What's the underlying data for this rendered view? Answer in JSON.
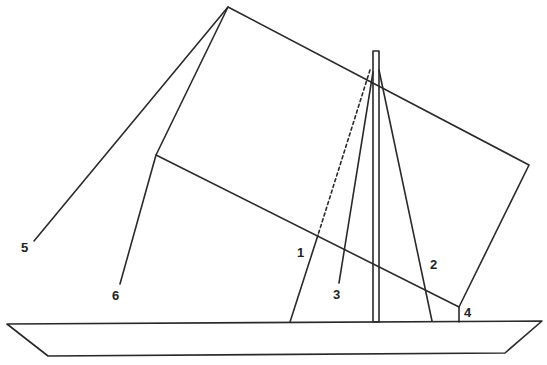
{
  "figure": {
    "type": "sailboat-rigging-diagram",
    "labels": [
      {
        "id": "1",
        "text": "1",
        "x": 297,
        "y": 246
      },
      {
        "id": "2",
        "text": "2",
        "x": 430,
        "y": 258
      },
      {
        "id": "3",
        "text": "3",
        "x": 333,
        "y": 288
      },
      {
        "id": "4",
        "text": "4",
        "x": 464,
        "y": 306
      },
      {
        "id": "5",
        "text": "5",
        "x": 21,
        "y": 241
      },
      {
        "id": "6",
        "text": "6",
        "x": 112,
        "y": 289
      }
    ],
    "colors": {
      "line": "#2a2a2a",
      "background": "#ffffff"
    }
  }
}
